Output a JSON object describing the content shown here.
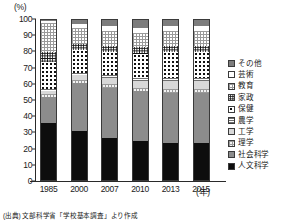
{
  "chart": {
    "unit_label": "(%)",
    "xaxis_unit": "(年)",
    "source_note": "(出典) 文部科学省「学校基本調査」より作成"
  },
  "legend": {
    "items": [
      {
        "label": "その他",
        "key": "sonota",
        "swatch": "f-sonota"
      },
      {
        "label": "芸術",
        "key": "geijutsu",
        "swatch": "f-geijutsu"
      },
      {
        "label": "教育",
        "key": "kyouiku",
        "swatch": "f-kyouiku"
      },
      {
        "label": "家政",
        "key": "kasei",
        "swatch": "f-kasei"
      },
      {
        "label": "保健",
        "key": "hoken",
        "swatch": "f-hoken"
      },
      {
        "label": "農学",
        "key": "nougaku",
        "swatch": "f-nougaku"
      },
      {
        "label": "工学",
        "key": "kougaku",
        "swatch": "f-kougaku"
      },
      {
        "label": "理学",
        "key": "rigaku",
        "swatch": "f-rigaku"
      },
      {
        "label": "社会科学",
        "key": "shakai",
        "swatch": "f-shakai"
      },
      {
        "label": "人文科学",
        "key": "jinbun",
        "swatch": "f-jinbun"
      }
    ]
  },
  "chart_data": {
    "type": "bar",
    "stacked": true,
    "title": "",
    "xlabel": "年",
    "ylabel": "(%)",
    "ylim": [
      0,
      100
    ],
    "yticks": [
      0,
      10,
      20,
      30,
      40,
      50,
      60,
      70,
      80,
      90,
      100
    ],
    "grid": false,
    "legend_position": "right",
    "categories": [
      "1985",
      "2000",
      "2007",
      "2010",
      "2013",
      "2015"
    ],
    "series": [
      {
        "name": "人文科学",
        "key": "jinbun",
        "fill": "f-jinbun",
        "values": [
          35,
          30,
          26,
          24,
          23,
          23
        ]
      },
      {
        "name": "社会科学",
        "key": "shakai",
        "fill": "f-shakai",
        "values": [
          16,
          30,
          31,
          31,
          31,
          31
        ]
      },
      {
        "name": "理学",
        "key": "rigaku",
        "fill": "f-rigaku",
        "values": [
          2,
          2,
          2,
          2,
          2,
          2
        ]
      },
      {
        "name": "工学",
        "key": "kougaku",
        "fill": "f-kougaku",
        "values": [
          2,
          3,
          4,
          4,
          5,
          5
        ]
      },
      {
        "name": "農学",
        "key": "nougaku",
        "fill": "f-nougaku",
        "values": [
          1,
          1,
          2,
          2,
          2,
          2
        ]
      },
      {
        "name": "保健",
        "key": "hoken",
        "fill": "f-hoken",
        "values": [
          17,
          14,
          14,
          15,
          16,
          16
        ]
      },
      {
        "name": "家政",
        "key": "kasei",
        "fill": "f-kasei",
        "values": [
          6,
          4,
          4,
          4,
          4,
          4
        ]
      },
      {
        "name": "教育",
        "key": "kyouiku",
        "fill": "f-kyouiku",
        "values": [
          18,
          10,
          9,
          9,
          9,
          9
        ]
      },
      {
        "name": "芸術",
        "key": "geijutsu",
        "fill": "f-geijutsu",
        "values": [
          1,
          2,
          3,
          3,
          3,
          3
        ]
      },
      {
        "name": "その他",
        "key": "sonota",
        "fill": "f-sonota",
        "values": [
          2,
          4,
          5,
          6,
          5,
          5
        ]
      }
    ]
  }
}
